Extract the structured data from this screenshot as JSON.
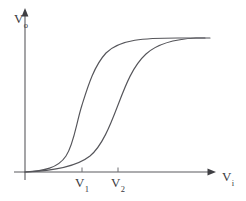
{
  "figure": {
    "type": "line-chart",
    "background_color": "#ffffff",
    "curve_color": "#55555a",
    "axis_color": "#5a5a5e",
    "text_color": "#3a3a3e"
  },
  "axes": {
    "y": {
      "label_main": "V",
      "label_sub": "o",
      "label_full": "Vo",
      "arrow": "up-arrow-icon"
    },
    "x": {
      "label_main": "V",
      "label_sub": "i",
      "label_full": "Vi",
      "arrow": "right-arrow-icon"
    }
  },
  "ticks": [
    {
      "name": "v1",
      "label_main": "V",
      "label_sub": "1",
      "label_full": "V1",
      "x_px": 82
    },
    {
      "name": "v2",
      "label_main": "V",
      "label_sub": "2",
      "label_full": "V2",
      "x_px": 118
    }
  ],
  "chart_data": {
    "type": "line",
    "title": "",
    "xlabel": "Vi",
    "ylabel": "Vo",
    "grid": false,
    "legend": false,
    "xlim": [
      0,
      1
    ],
    "ylim": [
      0,
      1
    ],
    "annotations": [
      "V1",
      "V2"
    ],
    "series": [
      {
        "name": "curve-left",
        "description": "Lower-threshold sigmoid transfer curve, inflection at V1",
        "path": "M 25 172 C 44 171, 58 168, 66 156 C 74 144, 76 124, 82 105 C 88 86, 94 66, 106 53 C 120 39, 145 38, 178 38 L 205 38",
        "x": [
          0.0,
          0.1,
          0.22,
          0.3,
          0.36,
          0.42,
          0.5,
          0.6,
          0.72,
          0.85,
          1.0
        ],
        "y": [
          0.0,
          0.01,
          0.06,
          0.18,
          0.35,
          0.52,
          0.7,
          0.84,
          0.94,
          0.99,
          1.0
        ]
      },
      {
        "name": "curve-right",
        "description": "Upper-threshold sigmoid transfer curve, inflection at V2",
        "path": "M 25 172 C 52 171, 76 167, 90 156 C 102 146, 110 126, 118 105 C 126 84, 133 66, 146 54 C 158 43, 176 39, 196 38 L 210 38",
        "x": [
          0.0,
          0.14,
          0.3,
          0.42,
          0.5,
          0.56,
          0.62,
          0.72,
          0.82,
          0.92,
          1.0
        ],
        "y": [
          0.0,
          0.01,
          0.05,
          0.16,
          0.32,
          0.5,
          0.66,
          0.84,
          0.94,
          0.99,
          1.0
        ]
      }
    ]
  }
}
